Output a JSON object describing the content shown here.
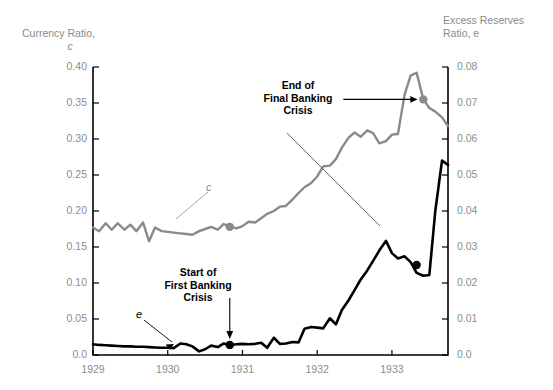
{
  "chart_data": {
    "type": "line",
    "title": "",
    "xlabel": "",
    "ylabel": "Currency Ratio, c",
    "y2label": "Excess Reserves Ratio, e",
    "grid": false,
    "legend": "inline-curve-labels",
    "xlim": [
      1929.0,
      1933.75
    ],
    "ylim": [
      0.0,
      0.4
    ],
    "y2lim": [
      0.0,
      0.08
    ],
    "xticks": [
      "1929",
      "1930",
      "1931",
      "1932",
      "1933"
    ],
    "xtick_values": [
      1929,
      1930,
      1931,
      1932,
      1933
    ],
    "yticks_left": [
      "0.0",
      "0.05",
      "0.10",
      "0.15",
      "0.20",
      "0.25",
      "0.30",
      "0.35",
      "0.40"
    ],
    "ytick_values_left": [
      0.0,
      0.05,
      0.1,
      0.15,
      0.2,
      0.25,
      0.3,
      0.35,
      0.4
    ],
    "yticks_right": [
      "0.0",
      "0.01",
      "0.02",
      "0.03",
      "0.04",
      "0.05",
      "0.06",
      "0.07",
      "0.08"
    ],
    "ytick_values_right": [
      0.0,
      0.01,
      0.02,
      0.03,
      0.04,
      0.05,
      0.06,
      0.07,
      0.08
    ],
    "series": [
      {
        "name": "c",
        "label": "c",
        "axis": "left",
        "color": "#8a8a8a",
        "x": [
          1929.0,
          1929.08,
          1929.17,
          1929.25,
          1929.33,
          1929.42,
          1929.5,
          1929.58,
          1929.67,
          1929.75,
          1929.83,
          1929.92,
          1930.0,
          1930.08,
          1930.17,
          1930.25,
          1930.33,
          1930.42,
          1930.5,
          1930.58,
          1930.67,
          1930.75,
          1930.83,
          1930.92,
          1931.0,
          1931.08,
          1931.17,
          1931.25,
          1931.33,
          1931.42,
          1931.5,
          1931.58,
          1931.67,
          1931.75,
          1931.83,
          1931.92,
          1932.0,
          1932.08,
          1932.17,
          1932.25,
          1932.33,
          1932.42,
          1932.5,
          1932.58,
          1932.67,
          1932.75,
          1932.83,
          1932.92,
          1933.0,
          1933.08,
          1933.17,
          1933.25,
          1933.33,
          1933.42,
          1933.5,
          1933.58,
          1933.67,
          1933.75
        ],
        "values": [
          0.177,
          0.172,
          0.183,
          0.174,
          0.183,
          0.174,
          0.181,
          0.172,
          0.184,
          0.158,
          0.177,
          0.172,
          0.171,
          0.17,
          0.169,
          0.168,
          0.167,
          0.172,
          0.175,
          0.178,
          0.174,
          0.182,
          0.178,
          0.176,
          0.179,
          0.185,
          0.184,
          0.19,
          0.196,
          0.2,
          0.206,
          0.207,
          0.216,
          0.225,
          0.233,
          0.239,
          0.248,
          0.262,
          0.263,
          0.272,
          0.288,
          0.302,
          0.309,
          0.303,
          0.312,
          0.308,
          0.294,
          0.297,
          0.306,
          0.307,
          0.362,
          0.388,
          0.392,
          0.355,
          0.343,
          0.338,
          0.33,
          0.318
        ]
      },
      {
        "name": "e",
        "label": "e",
        "axis": "right",
        "color": "#000000",
        "x": [
          1929.0,
          1929.08,
          1929.17,
          1929.25,
          1929.33,
          1929.42,
          1929.5,
          1929.58,
          1929.67,
          1929.75,
          1929.83,
          1929.92,
          1930.0,
          1930.08,
          1930.17,
          1930.25,
          1930.33,
          1930.42,
          1930.5,
          1930.58,
          1930.67,
          1930.75,
          1930.83,
          1930.92,
          1931.0,
          1931.08,
          1931.17,
          1931.25,
          1931.33,
          1931.42,
          1931.5,
          1931.58,
          1931.67,
          1931.75,
          1931.83,
          1931.92,
          1932.0,
          1932.08,
          1932.17,
          1932.25,
          1932.33,
          1932.42,
          1932.5,
          1932.58,
          1932.67,
          1932.75,
          1932.83,
          1932.92,
          1933.0,
          1933.08,
          1933.17,
          1933.25,
          1933.33,
          1933.42,
          1933.5,
          1933.58,
          1933.67,
          1933.75
        ],
        "values": [
          0.003,
          0.0028,
          0.0027,
          0.0026,
          0.0025,
          0.0024,
          0.0024,
          0.0023,
          0.0023,
          0.0022,
          0.0021,
          0.002,
          0.002,
          0.0019,
          0.0032,
          0.003,
          0.0024,
          0.001,
          0.0016,
          0.0026,
          0.0022,
          0.0032,
          0.0028,
          0.003,
          0.0031,
          0.003,
          0.0031,
          0.0034,
          0.002,
          0.0048,
          0.0031,
          0.0032,
          0.0036,
          0.0035,
          0.0073,
          0.0078,
          0.0076,
          0.0074,
          0.0102,
          0.0085,
          0.0125,
          0.0152,
          0.018,
          0.0209,
          0.0235,
          0.0262,
          0.029,
          0.0317,
          0.0283,
          0.0268,
          0.0274,
          0.0258,
          0.0228,
          0.022,
          0.0222,
          0.04,
          0.054,
          0.0528
        ]
      }
    ],
    "annotations": [
      {
        "name": "end-of-final-banking-crisis",
        "text": "End of\nFinal Banking\nCrisis",
        "target_series": "c",
        "target_x": 1933.42,
        "target_y": 0.355,
        "marker": "filled-circle",
        "marker_color": "#8a8a8a",
        "arrow": "horizontal-right"
      },
      {
        "name": "start-of-first-banking-crisis",
        "text": "Start of\nFirst Banking\nCrisis",
        "target_series": "e",
        "target_x": 1930.83,
        "target_y": 0.0028,
        "marker": "filled-circle",
        "marker_color": "#000000",
        "arrow": "vertical-down"
      }
    ],
    "markers": [
      {
        "name": "c-marker-start-first-crisis",
        "series": "c",
        "x": 1930.83,
        "y": 0.178,
        "color": "#8a8a8a"
      },
      {
        "name": "e-marker-end-final-crisis",
        "series": "e",
        "x": 1933.33,
        "y": 0.025,
        "color": "#000000"
      }
    ],
    "curve_labels": [
      {
        "name": "c-curve-label",
        "text": "c",
        "color": "#8a8a8a",
        "points_to_series": "c"
      },
      {
        "name": "e-curve-label",
        "text": "e",
        "color": "#000000",
        "points_to_series": "e"
      }
    ]
  },
  "axes": {
    "left_title_line1": "Currency Ratio,",
    "left_title_symbol": "c",
    "right_title": "Excess Reserves\nRatio, e"
  },
  "annotations": {
    "end_crisis": "End of\nFinal Banking\nCrisis",
    "start_crisis": "Start of\nFirst Banking\nCrisis"
  },
  "curve_labels": {
    "c": "c",
    "e": "e"
  }
}
